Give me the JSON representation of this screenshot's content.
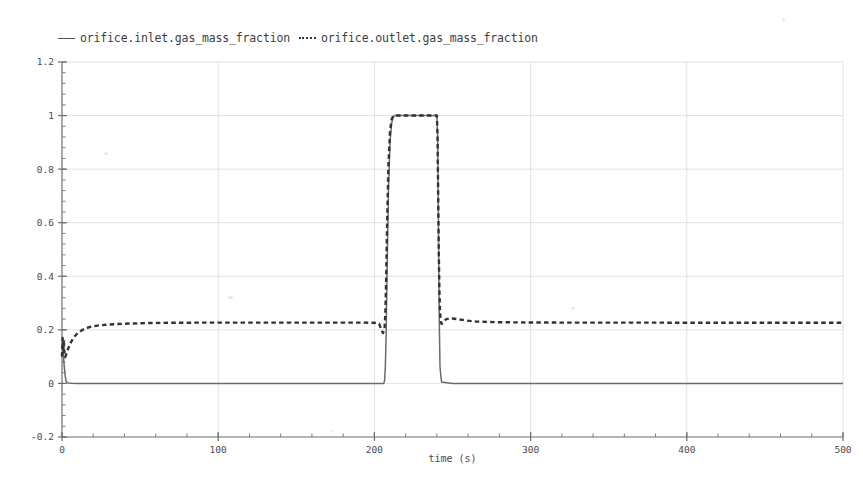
{
  "legend": {
    "position": "top-left",
    "entries": [
      {
        "label": "orifice.inlet.gas_mass_fraction",
        "style": "solid",
        "color": "#555555",
        "icon": "solid-line-swatch-icon"
      },
      {
        "label": "orifice.outlet.gas_mass_fraction",
        "style": "dotted",
        "color": "#3a3a3a",
        "icon": "dotted-line-swatch-icon"
      }
    ]
  },
  "chart_data": {
    "type": "line",
    "title": "",
    "subtitle": "",
    "xlabel": "time (s)",
    "ylabel": "",
    "xlim": [
      0,
      500
    ],
    "ylim": [
      -0.2,
      1.2
    ],
    "xticks": [
      "0",
      "100",
      "200",
      "300",
      "400",
      "500"
    ],
    "xtick_values": [
      0,
      100,
      200,
      300,
      400,
      500
    ],
    "x_minor_tick_step": 20,
    "yticks": [
      "-0.2",
      "0",
      "0.2",
      "0.4",
      "0.6",
      "0.8",
      "1",
      "1.2"
    ],
    "ytick_values": [
      -0.2,
      0,
      0.2,
      0.4,
      0.6,
      0.8,
      1,
      1.2
    ],
    "y_minor_tick_step": 0.04,
    "grid": true,
    "grid_color": "#e2e2e2",
    "axis_color": "#6d6d6d",
    "background": "#ffffff",
    "legend_position": "top-left",
    "series": [
      {
        "name": "orifice.inlet.gas_mass_fraction",
        "style": "solid",
        "color": "#6b6b6b",
        "x": [
          0,
          0.5,
          1,
          1.5,
          2,
          2.5,
          3,
          4,
          6,
          10,
          20,
          40,
          60,
          100,
          140,
          180,
          200,
          203,
          205,
          206,
          206.5,
          207,
          207.5,
          208,
          209,
          210,
          211,
          212,
          213,
          240,
          240.5,
          241,
          241.5,
          242,
          243,
          250,
          280,
          320,
          380,
          440,
          500
        ],
        "y": [
          0.1,
          0.12,
          0.095,
          0.06,
          0.03,
          0.012,
          0.005,
          0.002,
          0.001,
          0.0,
          0.0,
          0.0,
          0.0,
          0.0,
          0.0,
          0.0,
          0.0,
          0.0,
          0.0,
          0.0,
          0.01,
          0.06,
          0.18,
          0.38,
          0.72,
          0.9,
          0.97,
          0.995,
          1.0,
          1.0,
          0.92,
          0.6,
          0.25,
          0.06,
          0.005,
          0.0,
          0.0,
          0.0,
          0.0,
          0.0,
          0.0
        ]
      },
      {
        "name": "orifice.outlet.gas_mass_fraction",
        "style": "dotted",
        "color": "#333333",
        "x": [
          0,
          0.4,
          0.8,
          1.2,
          1.6,
          2,
          2.5,
          3,
          4,
          5,
          6,
          8,
          10,
          14,
          18,
          24,
          30,
          40,
          55,
          70,
          90,
          120,
          160,
          190,
          200,
          203,
          204.5,
          205.5,
          206.5,
          207,
          207.5,
          208,
          209,
          210,
          211,
          212,
          213,
          240,
          240.4,
          240.8,
          241.2,
          241.6,
          242,
          242.5,
          243,
          244,
          245,
          246,
          248,
          250,
          253,
          258,
          265,
          280,
          300,
          330,
          370,
          420,
          470,
          500
        ],
        "y": [
          0.1,
          0.17,
          0.125,
          0.155,
          0.105,
          0.098,
          0.105,
          0.115,
          0.13,
          0.145,
          0.157,
          0.175,
          0.188,
          0.203,
          0.211,
          0.217,
          0.22,
          0.223,
          0.2255,
          0.2265,
          0.227,
          0.227,
          0.227,
          0.227,
          0.2265,
          0.223,
          0.2,
          0.188,
          0.205,
          0.26,
          0.38,
          0.56,
          0.82,
          0.94,
          0.985,
          0.998,
          1.0,
          1.0,
          0.93,
          0.72,
          0.5,
          0.35,
          0.27,
          0.232,
          0.222,
          0.227,
          0.235,
          0.24,
          0.2425,
          0.2425,
          0.24,
          0.2355,
          0.231,
          0.2285,
          0.2275,
          0.227,
          0.227,
          0.2265,
          0.2265,
          0.2265
        ]
      }
    ],
    "annotations": [
      {
        "text": "pulse plateau at 1.0 between t=213 and t=240"
      },
      {
        "text": "outlet steady state approx 0.227"
      },
      {
        "text": "inlet steady state 0.0"
      }
    ]
  }
}
